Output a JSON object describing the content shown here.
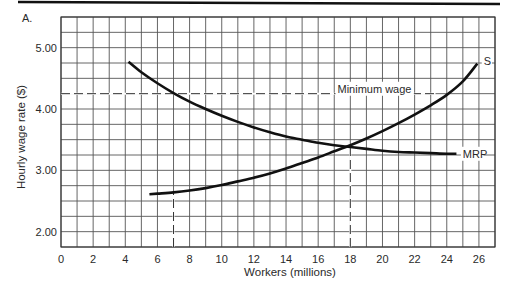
{
  "panel_label": "A.",
  "chart_data": {
    "type": "line",
    "title": "",
    "xlabel": "Workers (millions)",
    "ylabel": "Hourly wage rate ($)",
    "xlim": [
      0,
      27
    ],
    "ylim": [
      1.75,
      5.5
    ],
    "x_ticks": [
      0,
      2,
      4,
      6,
      8,
      10,
      12,
      14,
      16,
      18,
      20,
      22,
      24,
      26
    ],
    "x_tick_labels": [
      "0",
      "2",
      "4",
      "6",
      "8",
      "10",
      "12",
      "14",
      "16",
      "18",
      "20",
      "22",
      "24",
      "26"
    ],
    "y_ticks": [
      2,
      3,
      4,
      5
    ],
    "y_tick_labels": [
      "2.00",
      "3.00",
      "4.00",
      "5.00"
    ],
    "grid": {
      "on": true,
      "x_step": 1,
      "y_step": 0.25
    },
    "series": [
      {
        "name": "MRP",
        "label": "MRP",
        "points": [
          [
            4.2,
            4.77
          ],
          [
            5,
            4.6
          ],
          [
            6,
            4.42
          ],
          [
            7,
            4.26
          ],
          [
            8,
            4.12
          ],
          [
            9,
            4.0
          ],
          [
            10,
            3.89
          ],
          [
            11,
            3.79
          ],
          [
            12,
            3.7
          ],
          [
            13,
            3.62
          ],
          [
            14,
            3.55
          ],
          [
            15,
            3.5
          ],
          [
            16,
            3.45
          ],
          [
            17,
            3.41
          ],
          [
            18,
            3.38
          ],
          [
            19,
            3.35
          ],
          [
            20,
            3.32
          ],
          [
            21,
            3.3
          ],
          [
            22,
            3.29
          ],
          [
            23,
            3.28
          ],
          [
            24,
            3.27
          ],
          [
            24.6,
            3.27
          ]
        ]
      },
      {
        "name": "S",
        "label": "S",
        "points": [
          [
            5.5,
            2.61
          ],
          [
            6,
            2.62
          ],
          [
            7,
            2.64
          ],
          [
            8,
            2.67
          ],
          [
            9,
            2.71
          ],
          [
            10,
            2.76
          ],
          [
            11,
            2.82
          ],
          [
            12,
            2.88
          ],
          [
            13,
            2.95
          ],
          [
            14,
            3.03
          ],
          [
            15,
            3.12
          ],
          [
            16,
            3.21
          ],
          [
            17,
            3.31
          ],
          [
            18,
            3.41
          ],
          [
            19,
            3.52
          ],
          [
            20,
            3.64
          ],
          [
            21,
            3.77
          ],
          [
            22,
            3.91
          ],
          [
            23,
            4.06
          ],
          [
            24,
            4.23
          ],
          [
            25,
            4.45
          ],
          [
            25.9,
            4.74
          ]
        ]
      }
    ],
    "reference_lines": [
      {
        "type": "horizontal",
        "y": 4.25,
        "x_from": 0,
        "x_to": 23.3,
        "style": "dashed",
        "label": "Minimum wage"
      },
      {
        "type": "vertical",
        "x": 7,
        "y_from": 1.75,
        "y_to": 2.64,
        "style": "dashed"
      },
      {
        "type": "vertical",
        "x": 18,
        "y_from": 1.75,
        "y_to": 3.4,
        "style": "dashed"
      }
    ],
    "annotations": [
      {
        "text": "Minimum wage",
        "x": 17.2,
        "y": 4.33
      },
      {
        "text": "S",
        "x": 26.3,
        "y": 4.78
      },
      {
        "text": "MRP",
        "x": 25.0,
        "y": 3.27
      }
    ],
    "legend": "none (inline curve labels)"
  }
}
